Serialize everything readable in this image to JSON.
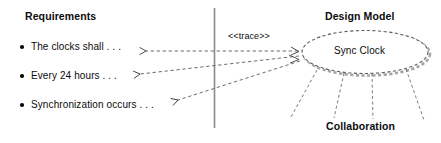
{
  "diagram": {
    "left_panel": {
      "heading": "Requirements",
      "items": [
        {
          "text": "The clocks shall . . ."
        },
        {
          "text": "Every 24 hours . . ."
        },
        {
          "text": "Synchronization occurs . . ."
        }
      ]
    },
    "right_panel": {
      "heading": "Design Model",
      "element_label": "Sync Clock",
      "collaboration_label": "Collaboration"
    },
    "relationship": {
      "stereotype": "<<trace>>"
    },
    "colors": {
      "ink": "#0c0c0c",
      "line": "#6b6b6b",
      "shadow": "#9a9a9a",
      "divider": "#8a8a8a",
      "background": "#ffffff"
    }
  }
}
